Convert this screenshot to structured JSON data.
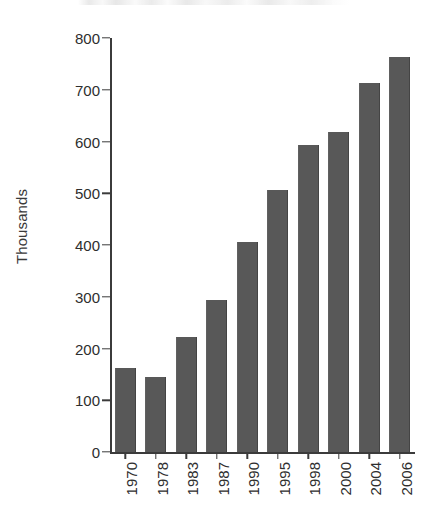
{
  "figure": {
    "background_color": "#ffffff",
    "bar_color": "#585858",
    "axis_color": "#3b3b3b",
    "text_color": "#2e2e2e",
    "title_remnant_note": "cropped title text clipped at top edge, illegible"
  },
  "chart_data": {
    "type": "bar",
    "title": "",
    "xlabel": "",
    "ylabel": "Thousands",
    "categories": [
      "1970",
      "1978",
      "1983",
      "1987",
      "1990",
      "1995",
      "1998",
      "2000",
      "2004",
      "2006"
    ],
    "values": [
      162,
      145,
      222,
      294,
      406,
      506,
      593,
      618,
      713,
      763
    ],
    "ylim": [
      0,
      800
    ],
    "ytick_labels": [
      "0",
      "100",
      "200",
      "300",
      "400",
      "500",
      "600",
      "700",
      "800"
    ],
    "ytick_values": [
      0,
      100,
      200,
      300,
      400,
      500,
      600,
      700,
      800
    ],
    "grid": false,
    "legend": null,
    "series": [
      {
        "name": "Thousands",
        "values": [
          162,
          145,
          222,
          294,
          406,
          506,
          593,
          618,
          713,
          763
        ]
      }
    ]
  }
}
